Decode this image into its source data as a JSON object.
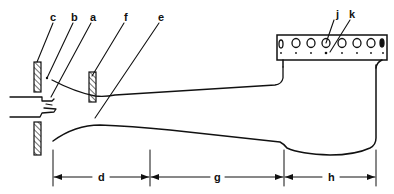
{
  "diagram": {
    "type": "technical-cross-section",
    "colors": {
      "line": "#111111",
      "background": "#ffffff"
    },
    "labels": {
      "a": "a",
      "b": "b",
      "c": "c",
      "e": "e",
      "f": "f",
      "j": "j",
      "k": "k",
      "d": "d",
      "g": "g",
      "h": "h"
    },
    "callouts": [
      {
        "id": "c",
        "points_to": "outer hatched plate (left)"
      },
      {
        "id": "b",
        "points_to": "air gap / opening"
      },
      {
        "id": "a",
        "points_to": "gas nozzle / jet"
      },
      {
        "id": "f",
        "points_to": "inner hatched plate (throat shutter)"
      },
      {
        "id": "e",
        "points_to": "mixing tube interior"
      },
      {
        "id": "j",
        "points_to": "burner port (large hole)"
      },
      {
        "id": "k",
        "points_to": "small port / retention hole"
      }
    ],
    "dimensions": [
      {
        "id": "d",
        "span": "inlet / throat section"
      },
      {
        "id": "g",
        "span": "tapered mixing tube section"
      },
      {
        "id": "h",
        "span": "burner head section"
      }
    ],
    "burner_head": {
      "large_ports": 8,
      "small_ports": 8
    }
  }
}
